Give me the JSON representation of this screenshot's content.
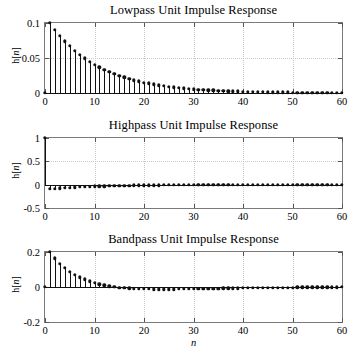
{
  "figure": {
    "width": 362,
    "height": 348,
    "background": "#ffffff",
    "axis_color": "#7a7a7a",
    "grid_color": "#c8c8c8",
    "stem_color": "#111111",
    "xlabel": "n"
  },
  "chart_data": [
    {
      "type": "line",
      "plot_style": "stem",
      "title": "Lowpass Unit Impulse Response",
      "xlabel": "",
      "ylabel": "h[n]",
      "xlim": [
        0,
        60
      ],
      "ylim": [
        0,
        0.1
      ],
      "xticks": [
        0,
        10,
        20,
        30,
        40,
        50,
        60
      ],
      "xticklabels": [
        "0",
        "10",
        "20",
        "30",
        "40",
        "50",
        "60"
      ],
      "yticks": [
        0,
        0.05,
        0.1
      ],
      "yticklabels": [
        "0",
        "0.05",
        "0.1"
      ],
      "grid": true,
      "legend": "none",
      "x": [
        0,
        1,
        2,
        3,
        4,
        5,
        6,
        7,
        8,
        9,
        10,
        11,
        12,
        13,
        14,
        15,
        16,
        17,
        18,
        19,
        20,
        21,
        22,
        23,
        24,
        25,
        26,
        27,
        28,
        29,
        30,
        31,
        32,
        33,
        34,
        35,
        36,
        37,
        38,
        39,
        40,
        41,
        42,
        43,
        44,
        45,
        46,
        47,
        48,
        49,
        50,
        51,
        52,
        53,
        54,
        55,
        56,
        57,
        58,
        59,
        60
      ],
      "values": [
        0,
        0.1,
        0.0905,
        0.0819,
        0.0741,
        0.0671,
        0.0607,
        0.0549,
        0.0497,
        0.045,
        0.0407,
        0.0368,
        0.0333,
        0.0302,
        0.0273,
        0.0247,
        0.0223,
        0.0202,
        0.0183,
        0.0166,
        0.015,
        0.0136,
        0.0123,
        0.0111,
        0.0101,
        0.0091,
        0.0082,
        0.0074,
        0.0067,
        0.0061,
        0.0055,
        0.005,
        0.0045,
        0.0041,
        0.0037,
        0.0033,
        0.003,
        0.0027,
        0.0025,
        0.0022,
        0.002,
        0.0018,
        0.0016,
        0.0015,
        0.0013,
        0.0012,
        0.0011,
        0.001,
        0.0009,
        0.0008,
        0.0007,
        0.0007,
        0.0006,
        0.0005,
        0.0005,
        0.0004,
        0.0004,
        0.0004,
        0.0003,
        0.0003,
        0.0003
      ]
    },
    {
      "type": "line",
      "plot_style": "stem",
      "title": "Highpass Unit Impulse Response",
      "xlabel": "",
      "ylabel": "h[n]",
      "xlim": [
        0,
        60
      ],
      "ylim": [
        -0.5,
        1
      ],
      "xticks": [
        0,
        10,
        20,
        30,
        40,
        50,
        60
      ],
      "xticklabels": [
        "0",
        "10",
        "20",
        "30",
        "40",
        "50",
        "60"
      ],
      "yticks": [
        -0.5,
        0,
        0.5,
        1
      ],
      "yticklabels": [
        "-0.5",
        "0",
        "0.5",
        "1"
      ],
      "grid": true,
      "legend": "none",
      "x": [
        0,
        1,
        2,
        3,
        4,
        5,
        6,
        7,
        8,
        9,
        10,
        11,
        12,
        13,
        14,
        15,
        16,
        17,
        18,
        19,
        20,
        21,
        22,
        23,
        24,
        25,
        26,
        27,
        28,
        29,
        30,
        31,
        32,
        33,
        34,
        35,
        36,
        37,
        38,
        39,
        40,
        41,
        42,
        43,
        44,
        45,
        46,
        47,
        48,
        49,
        50,
        51,
        52,
        53,
        54,
        55,
        56,
        57,
        58,
        59,
        60
      ],
      "values": [
        1,
        -0.094,
        -0.085,
        -0.077,
        -0.07,
        -0.063,
        -0.057,
        -0.052,
        -0.047,
        -0.042,
        -0.038,
        -0.035,
        -0.031,
        -0.028,
        -0.026,
        -0.023,
        -0.021,
        -0.019,
        -0.017,
        -0.016,
        -0.014,
        -0.013,
        -0.012,
        -0.01,
        -0.009,
        -0.009,
        -0.008,
        -0.007,
        -0.006,
        -0.006,
        -0.005,
        -0.005,
        -0.004,
        -0.004,
        -0.003,
        -0.003,
        -0.003,
        -0.003,
        -0.002,
        -0.002,
        -0.002,
        -0.002,
        -0.002,
        -0.001,
        -0.001,
        -0.001,
        -0.001,
        -0.001,
        -0.001,
        -0.001,
        -0.001,
        -0.001,
        -0.001,
        -0.001,
        0,
        0,
        0,
        0,
        0,
        0,
        0
      ]
    },
    {
      "type": "line",
      "plot_style": "stem",
      "title": "Bandpass Unit Impulse Response",
      "xlabel": "n",
      "ylabel": "h[n]",
      "xlim": [
        0,
        60
      ],
      "ylim": [
        -0.2,
        0.2
      ],
      "xticks": [
        0,
        10,
        20,
        30,
        40,
        50,
        60
      ],
      "xticklabels": [
        "0",
        "10",
        "20",
        "30",
        "40",
        "50",
        "60"
      ],
      "yticks": [
        -0.2,
        0,
        0.2
      ],
      "yticklabels": [
        "-0.2",
        "0",
        "0.2"
      ],
      "grid": true,
      "legend": "none",
      "x": [
        0,
        1,
        2,
        3,
        4,
        5,
        6,
        7,
        8,
        9,
        10,
        11,
        12,
        13,
        14,
        15,
        16,
        17,
        18,
        19,
        20,
        21,
        22,
        23,
        24,
        25,
        26,
        27,
        28,
        29,
        30,
        31,
        32,
        33,
        34,
        35,
        36,
        37,
        38,
        39,
        40,
        41,
        42,
        43,
        44,
        45,
        46,
        47,
        48,
        49,
        50,
        51,
        52,
        53,
        54,
        55,
        56,
        57,
        58,
        59,
        60
      ],
      "values": [
        0,
        0.2,
        0.163,
        0.133,
        0.108,
        0.087,
        0.07,
        0.055,
        0.043,
        0.032,
        0.023,
        0.016,
        0.009,
        0.004,
        0,
        -0.003,
        -0.006,
        -0.008,
        -0.01,
        -0.011,
        -0.012,
        -0.012,
        -0.013,
        -0.013,
        -0.013,
        -0.013,
        -0.013,
        -0.012,
        -0.012,
        -0.012,
        -0.011,
        -0.011,
        -0.01,
        -0.01,
        -0.009,
        -0.009,
        -0.008,
        -0.008,
        -0.007,
        -0.007,
        -0.006,
        -0.006,
        -0.005,
        -0.005,
        -0.005,
        -0.004,
        -0.004,
        -0.004,
        -0.003,
        -0.003,
        -0.003,
        -0.002,
        -0.002,
        -0.002,
        -0.002,
        -0.001,
        -0.001,
        -0.001,
        -0.001,
        -0.001,
        0
      ]
    }
  ]
}
